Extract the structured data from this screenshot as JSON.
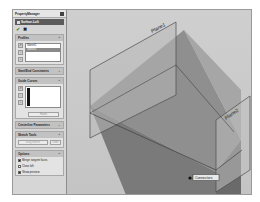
{
  "property_manager": {
    "title": "PropertyManager",
    "feature_name": "Surface-Loft",
    "ok_icon": "check-icon",
    "cancel_icon": "x-icon",
    "groups": {
      "profiles": {
        "label": "Profiles",
        "items": [
          "Sketch1",
          "Sketch2"
        ],
        "selected_index": 1
      },
      "constraints": {
        "label": "Start/End Constraints"
      },
      "guide_curves": {
        "label": "Guide Curves",
        "dropdown": "Faces"
      },
      "centerline": {
        "label": "Centerline Parameters"
      },
      "sketch_tools": {
        "label": "Sketch Tools",
        "button": "Drag Sketch",
        "undo": "Undo"
      },
      "options": {
        "label": "Options",
        "items": [
          {
            "label": "Merge tangent faces",
            "checked": true
          },
          {
            "label": "Close loft",
            "checked": false
          },
          {
            "label": "Show preview",
            "checked": true
          }
        ]
      }
    }
  },
  "viewport": {
    "planes": [
      {
        "name": "Plane1"
      },
      {
        "name": "Plane2"
      }
    ],
    "callout": "Connectors"
  }
}
